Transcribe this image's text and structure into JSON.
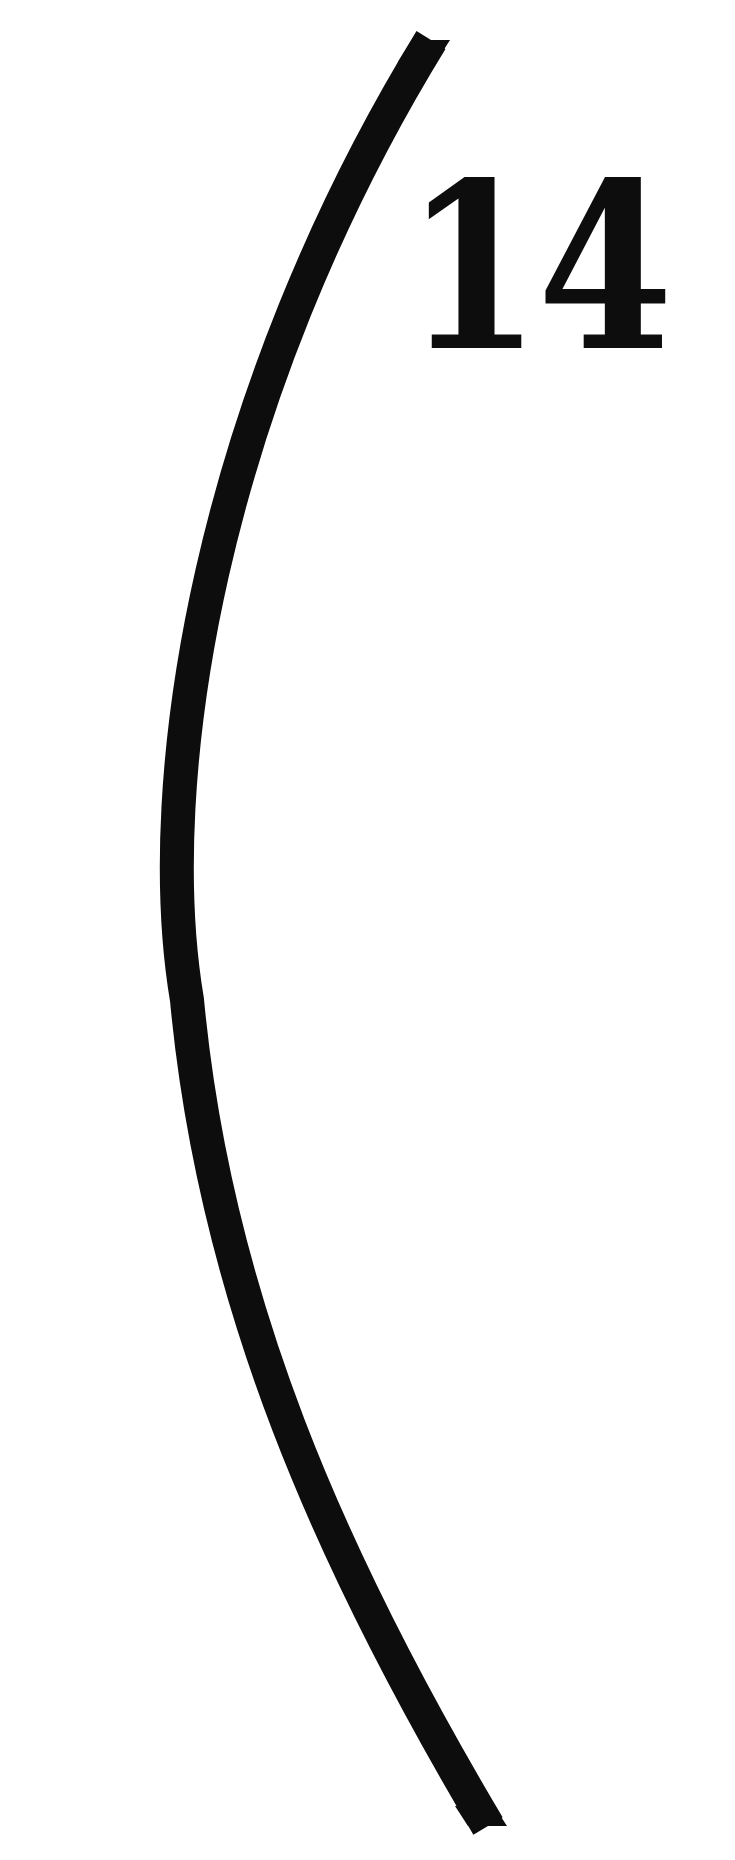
{
  "figure": {
    "number_label": "14",
    "shape": "left-parenthesis-arc",
    "colors": {
      "background": "#ffffff",
      "stroke": "#0d0d0d",
      "text": "#0d0d0d"
    }
  }
}
